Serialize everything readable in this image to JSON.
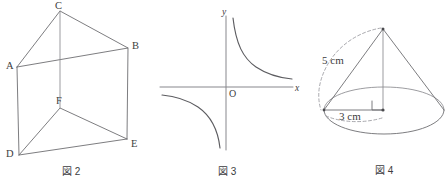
{
  "page": {
    "background_color": "#ffffff",
    "line_color": "#6e6e72",
    "text_color": "#3c3c40",
    "width": 448,
    "height": 186
  },
  "figures": [
    {
      "id": "fig2",
      "caption": "図 2",
      "kind": "triangular-prism",
      "description": "三角柱 ABC-DEF",
      "vertices": [
        {
          "name": "A",
          "label": "A",
          "x": 17,
          "y": 67,
          "label_x": 6,
          "label_y": 61
        },
        {
          "name": "B",
          "label": "B",
          "x": 128,
          "y": 48,
          "label_x": 132,
          "label_y": 41
        },
        {
          "name": "C",
          "label": "C",
          "x": 60,
          "y": 11,
          "label_x": 55,
          "label_y": 1
        },
        {
          "name": "D",
          "label": "D",
          "x": 19,
          "y": 155,
          "label_x": 6,
          "label_y": 149
        },
        {
          "name": "E",
          "label": "E",
          "x": 127,
          "y": 139,
          "label_x": 131,
          "label_y": 139
        },
        {
          "name": "F",
          "label": "F",
          "x": 60,
          "y": 108,
          "label_x": 56,
          "label_y": 96
        }
      ],
      "caption_x": 62,
      "caption_y": 167
    },
    {
      "id": "fig3",
      "caption": "図 3",
      "kind": "hyperbola-graph",
      "description": "反比例のグラフ y = a/x (a > 0)",
      "axis": {
        "y_label": "y",
        "x_label": "x",
        "origin_label": "O",
        "y_label_x": 222,
        "y_label_y": 8,
        "x_label_x": 295,
        "x_label_y": 84,
        "origin_label_x": 229,
        "origin_label_y": 89
      },
      "caption_x": 218,
      "caption_y": 167
    },
    {
      "id": "fig4",
      "caption": "図 4",
      "kind": "cone",
      "description": "円錐",
      "labels": [
        {
          "name": "slant-height",
          "text": "5 cm",
          "x": 322,
          "y": 55
        },
        {
          "name": "base-radius",
          "text": "3 cm",
          "x": 339,
          "y": 111
        }
      ],
      "measurements": {
        "slant_height": "5 cm",
        "radius": "3 cm"
      },
      "caption_x": 375,
      "caption_y": 166
    }
  ]
}
